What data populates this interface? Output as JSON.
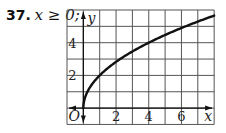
{
  "problem": {
    "number": "37.",
    "condition": "x ≥ 0;"
  },
  "colors": {
    "grid": "#555555",
    "curve": "#111111",
    "background": "#ffffff"
  },
  "chart_data": {
    "type": "line",
    "title": "",
    "function": "y = 2√x",
    "xlabel": "x",
    "ylabel": "y",
    "origin_label": "O",
    "xlim": [
      -1,
      8
    ],
    "ylim": [
      -1,
      6
    ],
    "grid": true,
    "x_ticks": [
      2,
      4,
      6
    ],
    "y_ticks": [
      2,
      4
    ],
    "series": [
      {
        "name": "y = 2√x",
        "x": [
          0,
          0.25,
          0.5,
          1,
          2,
          3,
          4,
          5,
          6,
          7,
          8
        ],
        "y": [
          0,
          1,
          1.41,
          2,
          2.83,
          3.46,
          4,
          4.47,
          4.9,
          5.29,
          5.66
        ]
      }
    ]
  }
}
